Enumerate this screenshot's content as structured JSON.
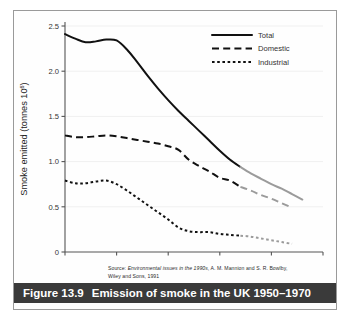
{
  "figure": {
    "caption_number": "Figure 13.9",
    "caption_text": "Emission of smoke in the UK 1950–1970",
    "source_prefix": "Source: ",
    "source_title": "Environmental issues in the 1990s",
    "source_rest": ", A. M. Mannion and S. R. Bowlby,",
    "source_line2": "Wiley and Sons, 1991"
  },
  "colors": {
    "observed": "#111111",
    "projected": "#9b9b9b",
    "grid": "#f0f0f0",
    "axis": "#555555",
    "caption_bar": "#3a3a3a",
    "frame": "#9a9a9a"
  },
  "chart_data": {
    "type": "line",
    "title": "Emission of smoke in the UK 1950–1970",
    "xlabel": "",
    "ylabel": "Smoke emitted (tonnes 10⁶)",
    "ylabel_main": "Smoke emitted (tonnes 10",
    "ylabel_sup": "6",
    "ylabel_tail": ")",
    "xlim": [
      1950,
      1975
    ],
    "ylim": [
      0,
      2.5
    ],
    "xticks": [
      1950,
      1955,
      1960,
      1965,
      1970,
      1975
    ],
    "xtick_labels": [
      "1950",
      "1955",
      "1960",
      "1965",
      "1970",
      "1975"
    ],
    "yticks": [
      0,
      0.5,
      1.0,
      1.5,
      2.0,
      2.5
    ],
    "ytick_labels": [
      "0",
      "0.5",
      "1.0",
      "1.5",
      "2.0",
      "2.5"
    ],
    "grid": "horizontal-faint",
    "legend_position": "top-right",
    "projection_starts_at": 1967,
    "series": [
      {
        "name": "Total",
        "style": "solid",
        "legend_label": "Total",
        "x": [
          1950,
          1951,
          1952,
          1953,
          1954,
          1955,
          1956,
          1957,
          1958,
          1959,
          1960,
          1961,
          1962,
          1963,
          1964,
          1965,
          1966,
          1967,
          1968,
          1969,
          1970,
          1971,
          1972,
          1973
        ],
        "values": [
          2.41,
          2.36,
          2.32,
          2.33,
          2.35,
          2.34,
          2.24,
          2.1,
          1.95,
          1.81,
          1.68,
          1.56,
          1.45,
          1.34,
          1.23,
          1.12,
          1.02,
          0.94,
          0.87,
          0.81,
          0.75,
          0.7,
          0.64,
          0.58
        ]
      },
      {
        "name": "Domestic",
        "style": "dashed",
        "legend_label": "Domestic",
        "x": [
          1950,
          1951,
          1952,
          1953,
          1954,
          1955,
          1956,
          1957,
          1958,
          1959,
          1960,
          1961,
          1962,
          1963,
          1964,
          1965,
          1966,
          1967,
          1968,
          1969,
          1970,
          1971,
          1972
        ],
        "values": [
          1.29,
          1.27,
          1.27,
          1.28,
          1.29,
          1.28,
          1.26,
          1.24,
          1.22,
          1.2,
          1.17,
          1.13,
          1.02,
          0.95,
          0.89,
          0.82,
          0.79,
          0.72,
          0.68,
          0.63,
          0.59,
          0.54,
          0.49
        ]
      },
      {
        "name": "Industrial",
        "style": "dotted",
        "legend_label": "Industrial",
        "x": [
          1950,
          1951,
          1952,
          1953,
          1954,
          1955,
          1956,
          1957,
          1958,
          1959,
          1960,
          1961,
          1962,
          1963,
          1964,
          1965,
          1966,
          1967,
          1968,
          1969,
          1970,
          1971,
          1972
        ],
        "values": [
          0.79,
          0.76,
          0.76,
          0.78,
          0.79,
          0.75,
          0.68,
          0.6,
          0.52,
          0.44,
          0.36,
          0.27,
          0.23,
          0.22,
          0.22,
          0.2,
          0.19,
          0.18,
          0.17,
          0.15,
          0.13,
          0.11,
          0.09
        ]
      }
    ]
  }
}
